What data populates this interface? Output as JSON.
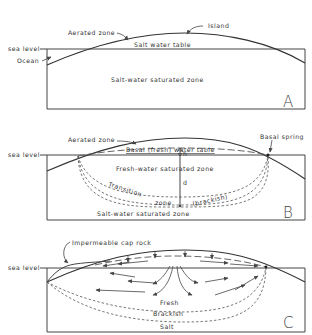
{
  "panels": [
    {
      "id": "A",
      "letter": "A",
      "labels": {
        "island": "Island",
        "aerated_zone": "Aerated zone",
        "salt_water_table": "Salt water table",
        "sea_level": "sea level",
        "ocean": "Ocean",
        "saturated_zone": "Salt-water saturated zone"
      }
    },
    {
      "id": "B",
      "letter": "B",
      "labels": {
        "aerated_zone": "Aerated zone",
        "basal_spring": "Basal spring",
        "water_table": "Basal (fresh) water table",
        "sea_level": "sea level",
        "h": "h",
        "d": "d",
        "fresh_zone": "Fresh-water saturated zone",
        "transition": "Transition",
        "zone": "zone",
        "brackish": "(brackish)",
        "salt_zone": "Salt-water saturated zone"
      }
    },
    {
      "id": "C",
      "letter": "C",
      "labels": {
        "cap_rock": "Impermeable cap rock",
        "sea_level": "sea level",
        "fresh": "Fresh",
        "brackish": "Brackish",
        "salt": "Salt"
      }
    }
  ]
}
